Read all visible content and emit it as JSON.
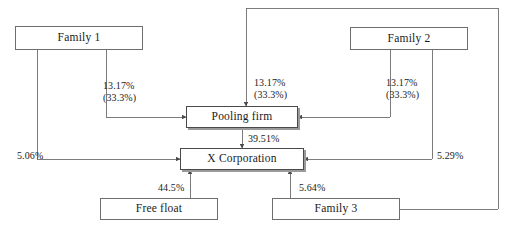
{
  "diagram": {
    "type": "ownership-flow-diagram",
    "line_color": "#6e6e6e",
    "text_color": "#1a1a1a",
    "background": "#ffffff",
    "nodes": [
      {
        "id": "family1",
        "label": "Family 1",
        "x": 15,
        "y": 26,
        "w": 128,
        "h": 24,
        "shadow": false
      },
      {
        "id": "family2",
        "label": "Family 2",
        "x": 350,
        "y": 27,
        "w": 118,
        "h": 23,
        "shadow": false
      },
      {
        "id": "poolingfirm",
        "label": "Pooling firm",
        "x": 186,
        "y": 106,
        "w": 112,
        "h": 22,
        "shadow": true
      },
      {
        "id": "xcorp",
        "label": "X Corporation",
        "x": 180,
        "y": 148,
        "w": 124,
        "h": 22,
        "shadow": true
      },
      {
        "id": "freefloat",
        "label": "Free float",
        "x": 100,
        "y": 198,
        "w": 118,
        "h": 22,
        "shadow": false
      },
      {
        "id": "family3",
        "label": "Family 3",
        "x": 272,
        "y": 198,
        "w": 128,
        "h": 22,
        "shadow": false
      }
    ],
    "edges": [
      {
        "id": "family1-to-poolingfirm",
        "from": "family1",
        "to": "poolingfirm",
        "value": "13.17%",
        "sub": "(33.3%)"
      },
      {
        "id": "family1-to-xcorp",
        "from": "family1",
        "to": "xcorp",
        "value": "5.06%",
        "sub": ""
      },
      {
        "id": "family2-to-poolingfirm",
        "from": "family2",
        "to": "poolingfirm",
        "value": "13.17%",
        "sub": "(33.3%)"
      },
      {
        "id": "family2-to-xcorp",
        "from": "family2",
        "to": "xcorp",
        "value": "5.29%",
        "sub": ""
      },
      {
        "id": "family3-to-poolingfirm",
        "from": "family3",
        "to": "poolingfirm",
        "value": "13.17%",
        "sub": "(33.3%)"
      },
      {
        "id": "family3-to-xcorp",
        "from": "family3",
        "to": "xcorp",
        "value": "5.64%",
        "sub": ""
      },
      {
        "id": "poolingfirm-to-xcorp",
        "from": "poolingfirm",
        "to": "xcorp",
        "value": "39.51%",
        "sub": ""
      },
      {
        "id": "freefloat-to-xcorp",
        "from": "freefloat",
        "to": "xcorp",
        "value": "44.5%",
        "sub": ""
      }
    ],
    "labels": {
      "family1_pooling": {
        "value": "13.17%",
        "sub": "(33.3%)",
        "x": 103,
        "y": 80
      },
      "family3_pooling": {
        "value": "13.17%",
        "sub": "(33.3%)",
        "x": 246,
        "y": 77
      },
      "family2_pooling": {
        "value": "13.17%",
        "sub": "(33.3%)",
        "x": 386,
        "y": 77
      },
      "pooling_xcorp": {
        "value": "39.51%",
        "sub": "",
        "x": 248,
        "y": 133
      },
      "family1_xcorp": {
        "value": "5.06%",
        "sub": "",
        "x": 17,
        "y": 148
      },
      "family2_xcorp": {
        "value": "5.29%",
        "sub": "",
        "x": 435,
        "y": 148
      },
      "freefloat_xcorp": {
        "value": "44.5%",
        "sub": "",
        "x": 158,
        "y": 182
      },
      "family3_xcorp": {
        "value": "5.64%",
        "sub": "",
        "x": 299,
        "y": 182
      }
    }
  }
}
